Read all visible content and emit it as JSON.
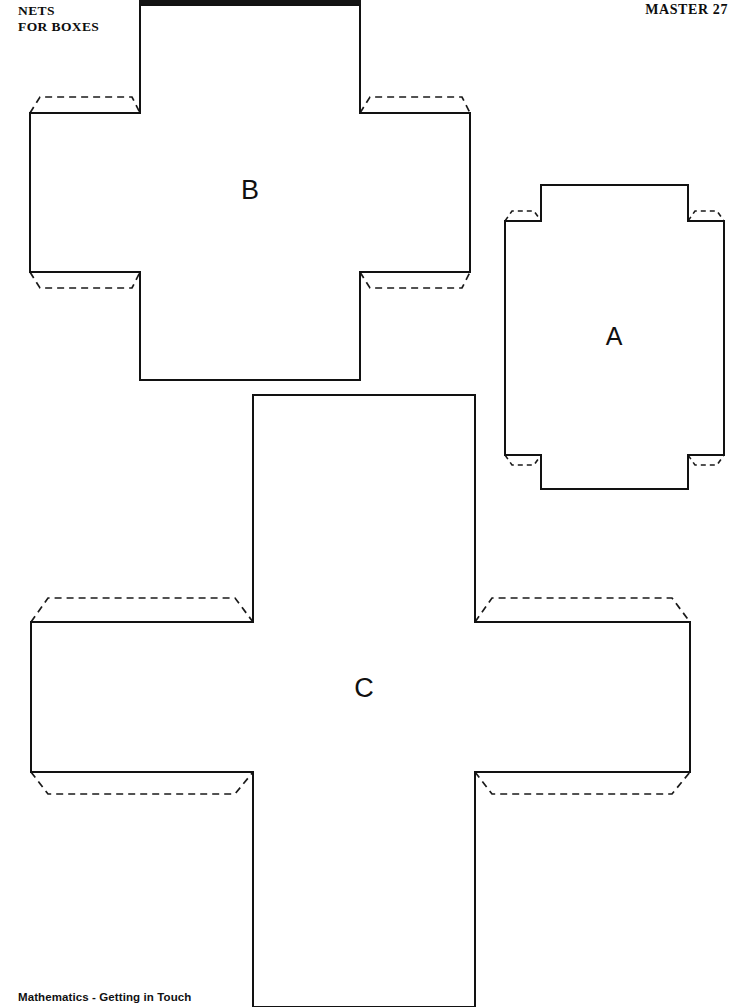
{
  "page": {
    "width": 742,
    "height": 1007,
    "background": "#ffffff",
    "ink_color": "#121212"
  },
  "header": {
    "title": "NETS\nFOR BOXES",
    "title_line1": "NETS",
    "title_line2": "FOR BOXES",
    "master_label": "MASTER 27"
  },
  "footer": {
    "source_text": "Mathematics - Getting in Touch"
  },
  "artifacts": {
    "top_scan_bar": {
      "present": true,
      "color": "#141414",
      "x": 139,
      "y": 0,
      "width": 222,
      "height": 6
    }
  },
  "nets": [
    {
      "id": "net-b",
      "label": "B",
      "shape": "cross",
      "description": "Cross-shaped net for a box with four dashed glue tabs on the corners of the horizontal arm",
      "label_x": 250,
      "label_y": 192,
      "outline": "M 140 5 L 360 5 L 360 113 L 470 113 L 470 272 L 360 272 L 360 380 L 140 380 L 140 272 L 30 272 L 30 113 L 140 113 Z",
      "tabs": [
        {
          "name": "tab-top-left",
          "path": "M 30 113 L 40 97 L 132 97 L 140 113"
        },
        {
          "name": "tab-top-right",
          "path": "M 360 113 L 370 97 L 462 97 L 470 113"
        },
        {
          "name": "tab-bottom-left",
          "path": "M 30 272 L 40 288 L 132 288 L 140 272"
        },
        {
          "name": "tab-bottom-right",
          "path": "M 360 272 L 370 288 L 462 288 L 470 272"
        }
      ]
    },
    {
      "id": "net-a",
      "label": "A",
      "shape": "cross-narrow",
      "description": "Tall cross-shaped net with short arms and four small dashed glue tabs",
      "label_x": 614,
      "label_y": 338,
      "outline": "M 541 185 L 688 185 L 688 221 L 724 221 L 724 455 L 688 455 L 688 489 L 541 489 L 541 455 L 505 455 L 505 221 L 541 221 Z",
      "tabs": [
        {
          "name": "tab-top-left",
          "path": "M 505 221 L 512 211 L 534 211 L 541 221"
        },
        {
          "name": "tab-top-right",
          "path": "M 688 221 L 695 211 L 717 211 L 724 221"
        },
        {
          "name": "tab-bottom-left",
          "path": "M 505 455 L 512 465 L 534 465 L 541 455"
        },
        {
          "name": "tab-bottom-right",
          "path": "M 688 455 L 695 465 L 717 465 L 724 455"
        }
      ]
    },
    {
      "id": "net-c",
      "label": "C",
      "shape": "cross",
      "description": "Large cross-shaped net with four dashed glue tabs; vertical arm runs off the bottom of the page",
      "label_x": 364,
      "label_y": 690,
      "outline": "M 253 395 L 475 395 L 475 622 L 690 622 L 690 772 L 475 772 L 475 1007 L 253 1007 L 253 772 L 31 772 L 31 622 L 253 622 Z",
      "tabs": [
        {
          "name": "tab-top-left",
          "path": "M 31 622 L 48 598 L 235 598 L 253 622"
        },
        {
          "name": "tab-top-right",
          "path": "M 475 622 L 492 598 L 672 598 L 690 622"
        },
        {
          "name": "tab-bottom-left",
          "path": "M 31 772 L 48 794 L 235 794 L 253 772"
        },
        {
          "name": "tab-bottom-right",
          "path": "M 475 772 L 492 794 L 672 794 L 690 772"
        }
      ]
    }
  ]
}
